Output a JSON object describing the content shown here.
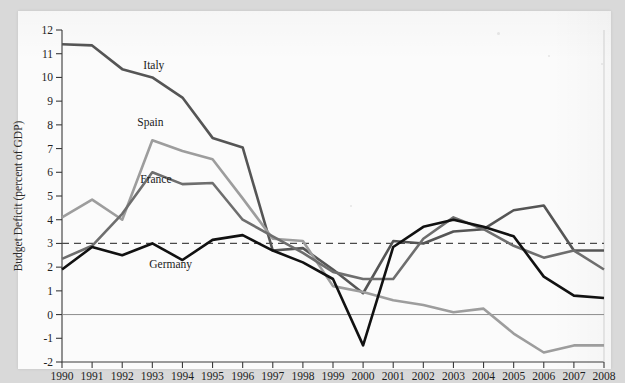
{
  "figure": {
    "kind": "line-chart-scan",
    "paper_color": "#fbfbfb",
    "page_background": "#d9d9d9"
  },
  "chart_data": {
    "type": "line",
    "title": "",
    "xlabel": "",
    "ylabel": "Budget Deficit (percent of GDP)",
    "x": [
      1990,
      1991,
      1992,
      1993,
      1994,
      1995,
      1996,
      1997,
      1998,
      1999,
      2000,
      2001,
      2002,
      2003,
      2004,
      2005,
      2006,
      2007,
      2008
    ],
    "xlim": [
      1990,
      2008
    ],
    "ylim": [
      -2,
      12
    ],
    "ytick_labels": [
      "12",
      "11",
      "10",
      "9",
      "8",
      "7",
      "6",
      "5",
      "4",
      "3",
      "2",
      "1",
      "0",
      "-1",
      "-2"
    ],
    "ytick_values": [
      12,
      11,
      10,
      9,
      8,
      7,
      6,
      5,
      4,
      3,
      2,
      1,
      0,
      -1,
      -2
    ],
    "xtick_labels": [
      "1990",
      "1991",
      "1992",
      "1993",
      "1994",
      "1995",
      "1996",
      "1997",
      "1998",
      "1999",
      "2000",
      "2001",
      "2002",
      "2003",
      "2004",
      "2005",
      "2006",
      "2007",
      "2008"
    ],
    "grid": false,
    "legend": "inline-labels",
    "annotations": [
      {
        "text": "Italy",
        "x": 1992.7,
        "y": 10.35,
        "color": "#555555"
      },
      {
        "text": "Spain",
        "x": 1992.5,
        "y": 7.95,
        "color": "#9d9d9d"
      },
      {
        "text": "France",
        "x": 1992.6,
        "y": 5.55,
        "color": "#6e6e6e"
      },
      {
        "text": "Germany",
        "x": 1992.9,
        "y": 1.95,
        "color": "#111111"
      }
    ],
    "reference_lines": [
      {
        "name": "maastricht-3-percent",
        "y": 3,
        "style": "dashed",
        "color": "#4a4a4a"
      },
      {
        "name": "zero-line",
        "y": 0,
        "style": "solid",
        "color": "#8c8c8c"
      }
    ],
    "series": [
      {
        "name": "Italy",
        "color": "#555555",
        "width": 2.6,
        "values": [
          11.4,
          11.35,
          10.35,
          10.0,
          9.15,
          7.45,
          7.05,
          2.7,
          2.8,
          1.9,
          0.9,
          3.1,
          3.0,
          3.5,
          3.6,
          4.4,
          4.6,
          2.7,
          2.7
        ]
      },
      {
        "name": "Spain",
        "color": "#9d9d9d",
        "width": 2.6,
        "values": [
          4.1,
          4.85,
          4.0,
          7.35,
          6.9,
          6.55,
          4.9,
          3.2,
          3.1,
          1.2,
          0.95,
          0.6,
          0.4,
          0.1,
          0.25,
          -0.8,
          -1.6,
          -1.3,
          -1.3
        ]
      },
      {
        "name": "France",
        "color": "#6e6e6e",
        "width": 2.6,
        "values": [
          2.35,
          2.9,
          4.25,
          6.0,
          5.5,
          5.55,
          4.0,
          3.3,
          2.6,
          1.8,
          1.5,
          1.5,
          3.2,
          4.1,
          3.6,
          2.9,
          2.4,
          2.7,
          1.9
        ]
      },
      {
        "name": "Germany",
        "color": "#111111",
        "width": 2.6,
        "values": [
          1.9,
          2.85,
          2.5,
          3.0,
          2.3,
          3.15,
          3.35,
          2.7,
          2.2,
          1.5,
          -1.3,
          2.85,
          3.7,
          4.0,
          3.7,
          3.3,
          1.6,
          0.8,
          0.7
        ]
      }
    ]
  }
}
